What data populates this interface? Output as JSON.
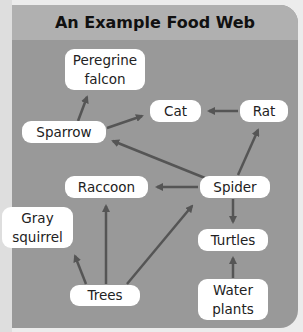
{
  "title": "An Example Food Web",
  "colors": {
    "panel": "#999999",
    "title_bar": "#b0b0b0",
    "node_fill": "#ffffff",
    "arrow": "#555555"
  },
  "nodes": {
    "peregrine_falcon": {
      "line1": "Peregrine",
      "line2": "falcon"
    },
    "cat": {
      "label": "Cat"
    },
    "rat": {
      "label": "Rat"
    },
    "sparrow": {
      "label": "Sparrow"
    },
    "raccoon": {
      "label": "Raccoon"
    },
    "spider": {
      "label": "Spider"
    },
    "gray_squirrel": {
      "line1": "Gray",
      "line2": "squirrel"
    },
    "turtles": {
      "label": "Turtles"
    },
    "trees": {
      "label": "Trees"
    },
    "water_plants": {
      "line1": "Water",
      "line2": "plants"
    }
  },
  "edges": [
    {
      "from": "Sparrow",
      "to": "Peregrine falcon"
    },
    {
      "from": "Sparrow",
      "to": "Cat"
    },
    {
      "from": "Rat",
      "to": "Cat"
    },
    {
      "from": "Spider",
      "to": "Sparrow"
    },
    {
      "from": "Spider",
      "to": "Rat"
    },
    {
      "from": "Spider",
      "to": "Raccoon"
    },
    {
      "from": "Spider",
      "to": "Turtles"
    },
    {
      "from": "Trees",
      "to": "Gray squirrel"
    },
    {
      "from": "Trees",
      "to": "Raccoon"
    },
    {
      "from": "Trees",
      "to": "Spider"
    },
    {
      "from": "Water plants",
      "to": "Turtles"
    }
  ]
}
